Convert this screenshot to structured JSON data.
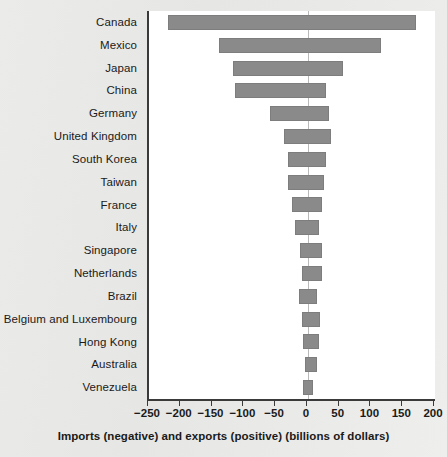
{
  "chart_data": {
    "type": "bar",
    "orientation": "horizontal",
    "title": "",
    "subtitle": "",
    "xlabel": "Imports (negative) and exports (positive) (billions of dollars)",
    "ylabel": "",
    "xlim": [
      -250,
      200
    ],
    "xticks": [
      -250,
      -200,
      -150,
      -100,
      -50,
      0,
      50,
      100,
      150,
      200
    ],
    "xtick_labels": [
      "−250",
      "−200",
      "−150",
      "−100",
      "−50",
      "0",
      "50",
      "100",
      "150",
      "200"
    ],
    "grid": false,
    "legend": "none",
    "zero_reference_line": true,
    "categories": [
      "Canada",
      "Mexico",
      "Japan",
      "China",
      "Germany",
      "United Kingdom",
      "South Korea",
      "Taiwan",
      "France",
      "Italy",
      "Singapore",
      "Netherlands",
      "Brazil",
      "Belgium and Luxembourg",
      "Hong Kong",
      "Australia",
      "Venezuela"
    ],
    "series": [
      {
        "name": "Imports (negative)",
        "values": [
          -220,
          -140,
          -118,
          -114,
          -60,
          -37,
          -32,
          -32,
          -25,
          -21,
          -12,
          -9,
          -14,
          -10,
          -8,
          -5,
          -8
        ]
      },
      {
        "name": "Exports (positive)",
        "values": [
          170,
          115,
          56,
          29,
          33,
          37,
          28,
          25,
          22,
          17,
          22,
          23,
          15,
          19,
          17,
          15,
          8
        ]
      }
    ],
    "colors": {
      "bar": "#8a8a8a",
      "bar_border": "#7d7d7d",
      "axis": "#3a3a3a",
      "zero_line": "#b9b9b9",
      "plot_background": "#ffffff",
      "page_background": "#e9e9e7"
    }
  }
}
